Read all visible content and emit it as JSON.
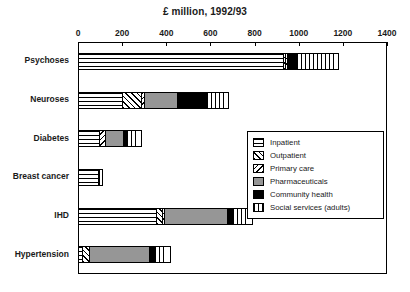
{
  "chart_data": {
    "type": "bar",
    "orientation": "horizontal",
    "stacked": true,
    "title": "£ million, 1992/93",
    "xlabel": "",
    "ylabel": "",
    "xlim": [
      0,
      1400
    ],
    "xticks": [
      0,
      200,
      400,
      600,
      800,
      1000,
      1200,
      1400
    ],
    "xticklabels": [
      "0",
      "200",
      "400",
      "600",
      "800",
      "1000",
      "1200",
      "1400"
    ],
    "grid": false,
    "legend_position": "center-right-inside",
    "categories": [
      "Psychoses",
      "Neuroses",
      "Diabetes",
      "Breast cancer",
      "IHD",
      "Hypertension"
    ],
    "series": [
      {
        "name": "Inpatient",
        "pattern": "horizontal-lines",
        "values": [
          930,
          200,
          95,
          90,
          355,
          20
        ]
      },
      {
        "name": "Outpatient",
        "pattern": "diagonal-up-hatch",
        "values": [
          12,
          90,
          0,
          6,
          28,
          35
        ]
      },
      {
        "name": "Primary care",
        "pattern": "diagonal-down-hatch",
        "values": [
          13,
          20,
          30,
          4,
          17,
          0
        ]
      },
      {
        "name": "Pharmaceuticals",
        "pattern": "solid-gray",
        "values": [
          0,
          150,
          90,
          0,
          290,
          275
        ]
      },
      {
        "name": "Community health",
        "pattern": "solid-black",
        "values": [
          45,
          140,
          15,
          10,
          25,
          30
        ]
      },
      {
        "name": "Social services (adults)",
        "pattern": "vertical-lines",
        "values": [
          180,
          80,
          55,
          0,
          75,
          55
        ]
      }
    ],
    "totals": [
      1180,
      680,
      285,
      110,
      790,
      415
    ],
    "colors": {
      "inpatient": "#ffffff",
      "outpatient": "#ffffff",
      "primary_care": "#ffffff",
      "pharmaceuticals": "#969696",
      "community_health": "#000000",
      "social_services": "#ffffff",
      "outline": "#000000",
      "background": "#ffffff",
      "text": "#1a1a1a"
    }
  },
  "legend": {
    "items": [
      {
        "label": "Inpatient",
        "pattern_class": "p-inpatient"
      },
      {
        "label": "Outpatient",
        "pattern_class": "p-outpatient"
      },
      {
        "label": "Primary care",
        "pattern_class": "p-primary"
      },
      {
        "label": "Pharmaceuticals",
        "pattern_class": "p-pharma"
      },
      {
        "label": "Community health",
        "pattern_class": "p-community"
      },
      {
        "label": "Social services (adults)",
        "pattern_class": "p-social"
      }
    ]
  }
}
